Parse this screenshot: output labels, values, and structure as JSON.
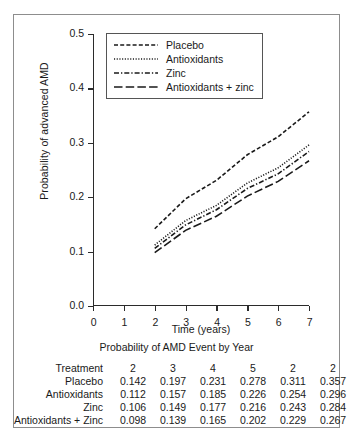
{
  "chart_data": {
    "type": "line",
    "title": "",
    "xlabel": "Time (years)",
    "ylabel": "Probability of advanced AMD",
    "xlim": [
      0,
      7
    ],
    "ylim": [
      0.0,
      0.5
    ],
    "xticks": [
      "0",
      "1",
      "2",
      "3",
      "4",
      "5",
      "6",
      "7"
    ],
    "yticks": [
      "0.0",
      "0.1",
      "0.2",
      "0.3",
      "0.4",
      "0.5"
    ],
    "grid": false,
    "legend_position": "upper-left",
    "x": [
      2,
      3,
      4,
      5,
      6,
      7
    ],
    "series": [
      {
        "name": "Placebo",
        "style": "dashed",
        "values": [
          0.142,
          0.197,
          0.231,
          0.278,
          0.311,
          0.357
        ]
      },
      {
        "name": "Antioxidants",
        "style": "dotted",
        "values": [
          0.112,
          0.157,
          0.185,
          0.226,
          0.254,
          0.296
        ]
      },
      {
        "name": "Zinc",
        "style": "dash-dot",
        "values": [
          0.106,
          0.149,
          0.177,
          0.216,
          0.243,
          0.284
        ]
      },
      {
        "name": "Antioxidants + zinc",
        "style": "long-dash",
        "values": [
          0.098,
          0.139,
          0.165,
          0.202,
          0.229,
          0.267
        ]
      }
    ]
  },
  "legend": {
    "items": [
      {
        "label": "Placebo"
      },
      {
        "label": "Antioxidants"
      },
      {
        "label": "Zinc"
      },
      {
        "label": "Antioxidants + zinc"
      }
    ]
  },
  "table": {
    "title": "Probability of AMD Event by Year",
    "header": [
      "Treatment",
      "2",
      "3",
      "4",
      "5",
      "2",
      "2"
    ],
    "rows": [
      {
        "label": "Placebo",
        "values": [
          "0.142",
          "0.197",
          "0.231",
          "0.278",
          "0.311",
          "0.357"
        ]
      },
      {
        "label": "Antioxidants",
        "values": [
          "0.112",
          "0.157",
          "0.185",
          "0.226",
          "0.254",
          "0.296"
        ]
      },
      {
        "label": "Zinc",
        "values": [
          "0.106",
          "0.149",
          "0.177",
          "0.216",
          "0.243",
          "0.284"
        ]
      },
      {
        "label": "Antioxidants + Zinc",
        "values": [
          "0.098",
          "0.139",
          "0.165",
          "0.202",
          "0.229",
          "0.267"
        ]
      }
    ]
  },
  "colors": {
    "line": "#1a1a1a",
    "axis": "#2b2b2b",
    "border": "#8d8d8d"
  }
}
